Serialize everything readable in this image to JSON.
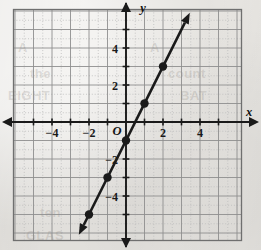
{
  "figure": {
    "kind": "coordinate-grid-line-graph",
    "origin_label": "O",
    "x_axis_name": "x",
    "y_axis_name": "y",
    "background_color": "#edebe7",
    "ink_color": "#1a1a1a",
    "grid_color": "#9a9a9a",
    "minor_grid_color": "#c2c2c2"
  },
  "bleed_text": [
    {
      "text": "A",
      "x": 18,
      "y": 40
    },
    {
      "text": "the",
      "x": 30,
      "y": 66
    },
    {
      "text": "EIGHT",
      "x": 8,
      "y": 88
    },
    {
      "text": "A",
      "x": 150,
      "y": 40
    },
    {
      "text": "count",
      "x": 168,
      "y": 66
    },
    {
      "text": "BAT",
      "x": 180,
      "y": 88
    },
    {
      "text": "ten",
      "x": 40,
      "y": 205
    },
    {
      "text": "GLAS",
      "x": 26,
      "y": 228
    }
  ],
  "chart_data": {
    "type": "line",
    "title": "",
    "xlabel": "x",
    "ylabel": "y",
    "grid": true,
    "legend": null,
    "xlim": [
      -6.1,
      6.2
    ],
    "ylim": [
      -6.1,
      6.2
    ],
    "x_ticks": [
      -4,
      -2,
      2,
      4
    ],
    "y_ticks": [
      4,
      2,
      -2,
      -4
    ],
    "x_tick_labels": [
      "−4",
      "−2",
      "2",
      "4"
    ],
    "y_tick_labels": [
      "4",
      "2",
      "−2",
      "−4"
    ],
    "series": [
      {
        "name": "line",
        "equation": "y = 2x - 1",
        "slope": 2,
        "intercept": -1,
        "x_start": -2.55,
        "x_end": 3.45,
        "arrow_start": true,
        "arrow_end": true,
        "points": [
          {
            "x": -2,
            "y": -5
          },
          {
            "x": -1,
            "y": -3
          },
          {
            "x": 0,
            "y": -1
          },
          {
            "x": 1,
            "y": 1
          },
          {
            "x": 2,
            "y": 3
          }
        ]
      }
    ]
  }
}
